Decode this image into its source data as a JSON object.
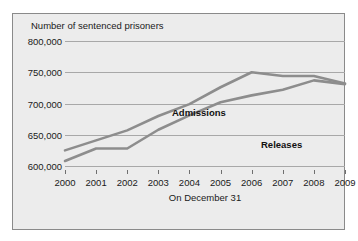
{
  "chart_data": {
    "type": "line",
    "title": "Number of sentenced prisoners",
    "xlabel": "On December 31",
    "ylabel": "",
    "categories": [
      "2000",
      "2001",
      "2002",
      "2003",
      "2004",
      "2005",
      "2006",
      "2007",
      "2008",
      "2009"
    ],
    "x": [
      2000,
      2001,
      2002,
      2003,
      2004,
      2005,
      2006,
      2007,
      2008,
      2009
    ],
    "ylim": [
      600000,
      800000
    ],
    "ytick_values": [
      600000,
      650000,
      700000,
      750000,
      800000
    ],
    "ytick_labels": [
      "600,000",
      "650,000",
      "700,000",
      "750,000",
      "800,000"
    ],
    "grid": true,
    "legend_position": "inline-labels",
    "series": [
      {
        "name": "Admissions",
        "color": "#8d8d8d",
        "values": [
          625000,
          641000,
          657000,
          680000,
          699000,
          726000,
          750000,
          744000,
          744000,
          732000
        ]
      },
      {
        "name": "Releases",
        "color": "#8d8d8d",
        "values": [
          608000,
          628000,
          628000,
          658000,
          681000,
          702000,
          713000,
          722000,
          737000,
          731000
        ]
      }
    ],
    "annotations": [
      {
        "text": "Admissions",
        "bold": true
      },
      {
        "text": "Releases",
        "bold": true
      }
    ]
  },
  "colors": {
    "figure_background": "#ececec",
    "figure_border": "#8a8a8a",
    "gridline": "#a8a8a8",
    "line": "#8d8d8d",
    "text": "#1a1a1a"
  }
}
